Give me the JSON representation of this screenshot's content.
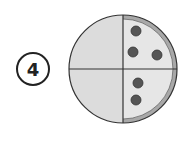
{
  "label": {
    "number": "4"
  },
  "pizza": {
    "center": [
      123,
      69
    ],
    "radius": 54,
    "crust_width": 5,
    "colors": {
      "plain": "#dcdcdc",
      "topped": "#e6e6e6",
      "crust": "#a8a8a8",
      "outline": "#333333",
      "topping": "#555555"
    },
    "toppings": [
      {
        "cx": 136,
        "cy": 31
      },
      {
        "cx": 133,
        "cy": 52
      },
      {
        "cx": 157,
        "cy": 55
      },
      {
        "cx": 138,
        "cy": 83
      },
      {
        "cx": 136,
        "cy": 100
      }
    ]
  }
}
